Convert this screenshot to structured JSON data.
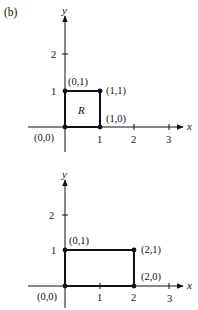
{
  "panel_label": "(b)",
  "axes": {
    "x_name": "x",
    "y_name": "y"
  },
  "top_plot": {
    "x_ticks": [
      "1",
      "2",
      "3"
    ],
    "y_ticks": [
      "1",
      "2"
    ],
    "region_label": "R",
    "points": [
      {
        "label": "(0,0)",
        "x": 0,
        "y": 0
      },
      {
        "label": "(1,0)",
        "x": 1,
        "y": 0
      },
      {
        "label": "(1,1)",
        "x": 1,
        "y": 1
      },
      {
        "label": "(0,1)",
        "x": 0,
        "y": 1
      }
    ]
  },
  "bottom_plot": {
    "x_ticks": [
      "1",
      "2",
      "3"
    ],
    "y_ticks": [
      "1",
      "2"
    ],
    "points": [
      {
        "label": "(0,0)",
        "x": 0,
        "y": 0
      },
      {
        "label": "(2,0)",
        "x": 2,
        "y": 0
      },
      {
        "label": "(2,1)",
        "x": 2,
        "y": 1
      },
      {
        "label": "(0,1)",
        "x": 0,
        "y": 1
      }
    ]
  }
}
